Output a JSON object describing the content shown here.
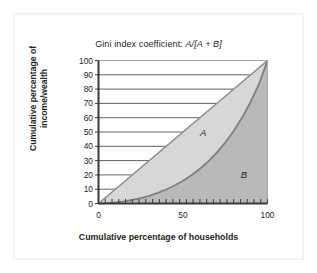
{
  "figure": {
    "title_prefix": "Gini index coefficient: ",
    "title_formula": "A/[A + B]",
    "xlabel": "Cumulative percentage of households",
    "ylabel_line1": "Cumulative percentage of",
    "ylabel_line2": "income/wealth",
    "background": "#ffffff",
    "frame_color": "#efefef"
  },
  "chart_data": {
    "type": "area",
    "title": "Gini index coefficient: A/[A + B]",
    "xlabel": "Cumulative percentage of households",
    "ylabel": "Cumulative percentage of income/wealth",
    "xlim": [
      0,
      100
    ],
    "ylim": [
      0,
      100
    ],
    "xticks": [
      0,
      50,
      100
    ],
    "xtick_labels": [
      "0",
      "50",
      "100"
    ],
    "yticks": [
      0,
      10,
      20,
      30,
      40,
      50,
      60,
      70,
      80,
      90,
      100
    ],
    "ytick_labels": [
      "0",
      "10",
      "20",
      "30",
      "40",
      "50",
      "60",
      "70",
      "80",
      "90",
      "100"
    ],
    "x_minor_tick_step": 4,
    "grid": "horizontal-gridlines-from-y-axis-to-line-of-equality",
    "legend": "none",
    "annotations": [
      {
        "label": "A",
        "x": 62,
        "y": 47,
        "style": "italic",
        "meaning": "area between line of equality and Lorenz curve"
      },
      {
        "label": "B",
        "x": 86,
        "y": 18,
        "style": "italic",
        "meaning": "area under Lorenz curve"
      }
    ],
    "series": [
      {
        "name": "Line of equality",
        "type": "line",
        "color": "#8c8c8c",
        "x": [
          0,
          100
        ],
        "values": [
          0,
          100
        ]
      },
      {
        "name": "Lorenz curve",
        "type": "line",
        "color": "#7f7f7f",
        "x": [
          0,
          5,
          10,
          15,
          20,
          25,
          30,
          35,
          40,
          45,
          50,
          55,
          60,
          65,
          70,
          75,
          80,
          85,
          90,
          95,
          100
        ],
        "values": [
          0,
          0.3,
          0.8,
          1.5,
          2.5,
          3.8,
          5.4,
          7.4,
          9.8,
          12.6,
          15.9,
          19.8,
          24.3,
          29.5,
          35.6,
          42.6,
          50.7,
          60.1,
          71.0,
          83.6,
          100
        ]
      }
    ],
    "regions": [
      {
        "name": "A",
        "fill": "#d7d7d7",
        "between": [
          "Line of equality",
          "Lorenz curve"
        ]
      },
      {
        "name": "B",
        "fill": "#b9b9b9",
        "between": [
          "Lorenz curve",
          "x-axis"
        ]
      }
    ]
  }
}
